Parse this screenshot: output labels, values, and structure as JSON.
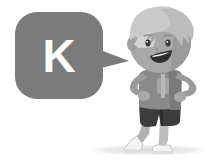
{
  "illustration": {
    "title": "Cartoon boy with speech bubble",
    "background_color": "#ffffff",
    "style": "grayscale-cartoon"
  },
  "speech_bubble": {
    "letter": "K",
    "letter_color": "#fbfbfb",
    "bubble_color": "#7b7b7b",
    "tail_direction": "right",
    "shape": "rounded-rectangle"
  },
  "character": {
    "name": "boy",
    "pose": "hands-on-hips",
    "hair": {
      "label": "spiky hair",
      "color": "#c9c9c9",
      "shade_color": "#b4b4b4"
    },
    "face": {
      "skin_color": "#a8a8a8",
      "skin_shade_color": "#949494",
      "eye_color": "#3a3a3a",
      "mouth_color": "#2f2f2f",
      "mouth_inner_color": "#ffffff",
      "expression": "smiling"
    },
    "shirt": {
      "label": "t-shirt",
      "color": "#8a8a8a",
      "shade_color": "#757575",
      "sleeve_color": "#9a9a9a",
      "graphic_color": "#b9b9b9"
    },
    "shorts": {
      "label": "shorts",
      "color": "#3c3c3c",
      "shade_color": "#2e2e2e"
    },
    "legs": {
      "label": "legs",
      "color": "#b0b0b0"
    },
    "shoes": {
      "label": "sneakers",
      "color": "#f2f2f2",
      "outline_color": "#c2c2c2",
      "sole_color": "#dcdcdc"
    }
  },
  "ground_shadow": {
    "label": "ground shadow",
    "color": "#e4e4e4"
  }
}
